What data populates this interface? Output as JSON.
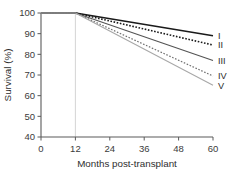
{
  "chart_data": {
    "type": "line",
    "title": "",
    "subtitle": "",
    "xlabel": "Months post-transplant",
    "ylabel": "Survival (%)",
    "xlim": [
      0,
      60
    ],
    "ylim": [
      40,
      100
    ],
    "xticks": [
      0,
      12,
      24,
      36,
      48,
      60
    ],
    "xtick_labels": [
      "0",
      "12",
      "24",
      "36",
      "48",
      "60"
    ],
    "yticks": [
      40,
      50,
      60,
      70,
      80,
      90,
      100
    ],
    "ytick_labels": [
      "40",
      "50",
      "60",
      "70",
      "80",
      "90",
      "100"
    ],
    "grid": false,
    "gridlines_vertical": [
      12
    ],
    "legend_position": "right-inline-end-labels",
    "x": [
      0,
      12,
      60
    ],
    "series": [
      {
        "name": "I",
        "label": "I",
        "values": [
          100,
          100,
          89
        ],
        "style": "solid",
        "color": "#1a1a1a",
        "width": 1.7
      },
      {
        "name": "II",
        "label": "II",
        "values": [
          100,
          100,
          84.5
        ],
        "style": "dotted",
        "color": "#1a1a1a",
        "width": 1.6
      },
      {
        "name": "III",
        "label": "III",
        "values": [
          100,
          100,
          77
        ],
        "style": "solid",
        "color": "#545454",
        "width": 1.1
      },
      {
        "name": "IV",
        "label": "IV",
        "values": [
          100,
          100,
          69.5
        ],
        "style": "dotted",
        "color": "#6e6e6e",
        "width": 1.2
      },
      {
        "name": "V",
        "label": "V",
        "values": [
          100,
          100,
          65
        ],
        "style": "solid",
        "color": "#a8a8a8",
        "width": 1.1
      }
    ],
    "colors": {
      "axis": "#5a5a5a",
      "text": "#2e2e2e",
      "gridline": "#c9c9c9",
      "background": "#ffffff"
    }
  }
}
